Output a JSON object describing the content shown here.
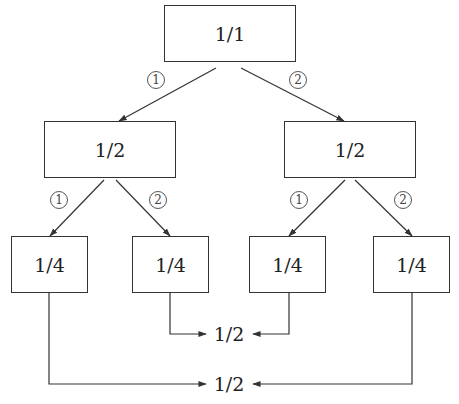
{
  "diagram": {
    "root": {
      "value": "1/1"
    },
    "level1": [
      {
        "value": "1/2",
        "edge_label": "1",
        "edge_symbol": "①"
      },
      {
        "value": "1/2",
        "edge_label": "2",
        "edge_symbol": "②"
      }
    ],
    "level2": [
      {
        "value": "1/4",
        "parent": 0,
        "edge_label": "1",
        "edge_symbol": "①"
      },
      {
        "value": "1/4",
        "parent": 0,
        "edge_label": "2",
        "edge_symbol": "②"
      },
      {
        "value": "1/4",
        "parent": 1,
        "edge_label": "1",
        "edge_symbol": "①"
      },
      {
        "value": "1/4",
        "parent": 1,
        "edge_label": "2",
        "edge_symbol": "②"
      }
    ],
    "merges": [
      {
        "value": "1/2",
        "sources": [
          1,
          2
        ]
      },
      {
        "value": "1/2",
        "sources": [
          0,
          3
        ]
      }
    ],
    "colors": {
      "line": "#333333",
      "text": "#222222",
      "background": "#ffffff"
    }
  }
}
